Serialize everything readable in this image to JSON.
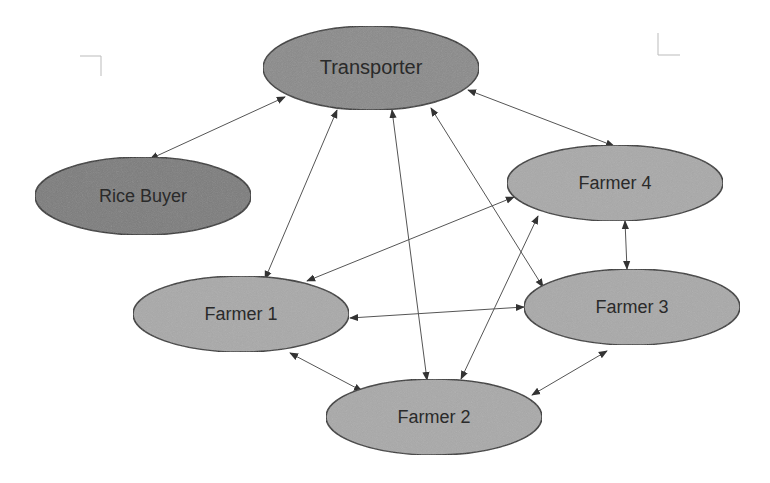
{
  "diagram": {
    "type": "network",
    "colors": {
      "transporter_fill": "#8a8a8a",
      "rice_buyer_fill": "#7c7c7c",
      "farmer_fill": "#a9a9a9",
      "edge": "#555555",
      "node_stroke": "#333333",
      "background": "#ffffff"
    },
    "nodes": [
      {
        "id": "transporter",
        "label": "Transporter",
        "cx": 371,
        "cy": 68,
        "rx": 108,
        "ry": 42,
        "fill": "#8a8a8a",
        "font_size": 20
      },
      {
        "id": "rice-buyer",
        "label": "Rice Buyer",
        "cx": 143,
        "cy": 196,
        "rx": 108,
        "ry": 39,
        "fill": "#7c7c7c",
        "font_size": 18
      },
      {
        "id": "farmer-4",
        "label": "Farmer 4",
        "cx": 615,
        "cy": 183,
        "rx": 108,
        "ry": 38,
        "fill": "#a9a9a9",
        "font_size": 18
      },
      {
        "id": "farmer-1",
        "label": "Farmer 1",
        "cx": 241,
        "cy": 314,
        "rx": 108,
        "ry": 38,
        "fill": "#a9a9a9",
        "font_size": 18
      },
      {
        "id": "farmer-3",
        "label": "Farmer 3",
        "cx": 632,
        "cy": 307,
        "rx": 108,
        "ry": 38,
        "fill": "#a9a9a9",
        "font_size": 18
      },
      {
        "id": "farmer-2",
        "label": "Farmer 2",
        "cx": 434,
        "cy": 417,
        "rx": 108,
        "ry": 38,
        "fill": "#a9a9a9",
        "font_size": 18
      }
    ],
    "edges": [
      {
        "from": "transporter",
        "to": "rice-buyer",
        "x1": 285,
        "y1": 97,
        "x2": 150,
        "y2": 159,
        "bidirectional": true
      },
      {
        "from": "transporter",
        "to": "farmer-4",
        "x1": 468,
        "y1": 90,
        "x2": 614,
        "y2": 146,
        "bidirectional": true
      },
      {
        "from": "transporter",
        "to": "farmer-1",
        "x1": 337,
        "y1": 110,
        "x2": 265,
        "y2": 279,
        "bidirectional": true
      },
      {
        "from": "transporter",
        "to": "farmer-2",
        "x1": 392,
        "y1": 110,
        "x2": 427,
        "y2": 380,
        "bidirectional": true
      },
      {
        "from": "transporter",
        "to": "farmer-3",
        "x1": 431,
        "y1": 108,
        "x2": 543,
        "y2": 287,
        "bidirectional": true
      },
      {
        "from": "farmer-4",
        "to": "farmer-1",
        "x1": 514,
        "y1": 197,
        "x2": 307,
        "y2": 281,
        "bidirectional": true
      },
      {
        "from": "farmer-4",
        "to": "farmer-2",
        "x1": 538,
        "y1": 216,
        "x2": 461,
        "y2": 379,
        "bidirectional": true
      },
      {
        "from": "farmer-4",
        "to": "farmer-3",
        "x1": 625,
        "y1": 221,
        "x2": 627,
        "y2": 269,
        "bidirectional": true
      },
      {
        "from": "farmer-1",
        "to": "farmer-3",
        "x1": 350,
        "y1": 318,
        "x2": 524,
        "y2": 307,
        "bidirectional": true
      },
      {
        "from": "farmer-1",
        "to": "farmer-2",
        "x1": 290,
        "y1": 353,
        "x2": 362,
        "y2": 391,
        "bidirectional": true
      },
      {
        "from": "farmer-3",
        "to": "farmer-2",
        "x1": 607,
        "y1": 351,
        "x2": 532,
        "y2": 395,
        "bidirectional": true
      }
    ],
    "crop_marks": [
      {
        "id": "top-left",
        "lines": [
          [
            80,
            56,
            101,
            56
          ],
          [
            101,
            56,
            101,
            76
          ]
        ]
      },
      {
        "id": "top-right",
        "lines": [
          [
            658,
            33,
            658,
            55
          ],
          [
            658,
            55,
            680,
            55
          ]
        ]
      }
    ]
  }
}
